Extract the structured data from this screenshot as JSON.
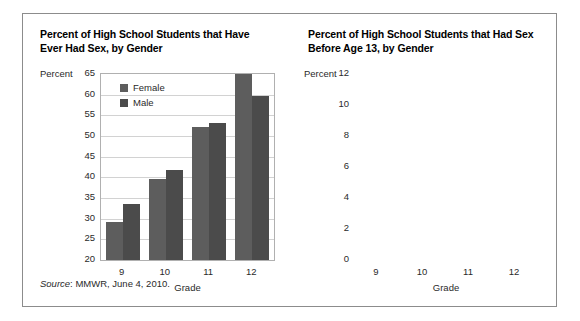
{
  "figure": {
    "source_prefix": "Source",
    "source_text": ": MMWR, June 4, 2010."
  },
  "legend": {
    "female_label": "Female",
    "male_label": "Male",
    "female_color": "#5d5d5d",
    "male_color": "#4b4b4b"
  },
  "chart_data": [
    {
      "type": "bar",
      "title": "Percent of High School Students that Have Ever Had Sex, by Gender",
      "xlabel": "Grade",
      "ylabel": "Percent",
      "categories": [
        "9",
        "10",
        "11",
        "12"
      ],
      "series": [
        {
          "name": "Female",
          "values": [
            29.3,
            39.5,
            52.3,
            65.0
          ]
        },
        {
          "name": "Male",
          "values": [
            33.5,
            41.8,
            53.2,
            59.6
          ]
        }
      ],
      "ylim": [
        20,
        65
      ],
      "yticks": [
        "20",
        "25",
        "30",
        "35",
        "40",
        "45",
        "50",
        "55",
        "60",
        "65"
      ],
      "grid": true,
      "legend_position": "top-left"
    },
    {
      "type": "bar",
      "title": "Percent of High School Students that Had Sex Before Age 13, by Gender",
      "xlabel": "Grade",
      "ylabel": "Percent",
      "categories": [
        "9",
        "10",
        "11",
        "12"
      ],
      "series": [
        {
          "name": "Female",
          "values": [
            3.6,
            3.6,
            2.7,
            2.2
          ]
        },
        {
          "name": "Male",
          "values": [
            11.3,
            9.0,
            5.9,
            6.4
          ]
        }
      ],
      "ylim": [
        0,
        12
      ],
      "yticks": [
        "0",
        "2",
        "4",
        "6",
        "8",
        "10",
        "12"
      ],
      "grid": true,
      "legend_position": "top-right"
    }
  ]
}
